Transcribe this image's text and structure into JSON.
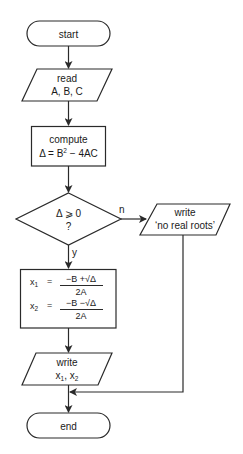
{
  "flowchart": {
    "start": {
      "label": "start"
    },
    "read": {
      "line1": "read",
      "line2": "A, B, C"
    },
    "compute": {
      "line1": "compute",
      "line2_prefix": "Δ = B",
      "line2_sup": "2",
      "line2_suffix": " − 4AC"
    },
    "decision": {
      "line1": "Δ ⩾ 0",
      "line2": "?",
      "yes_label": "y",
      "no_label": "n"
    },
    "roots": {
      "x1_var": "x",
      "x1_sub": "1",
      "x1_eq": "=",
      "x1_num": "−B +√Δ",
      "x1_den": "2A",
      "x2_var": "x",
      "x2_sub": "2",
      "x2_eq": "=",
      "x2_num": "−B −√Δ",
      "x2_den": "2A"
    },
    "write_roots": {
      "line1": "write",
      "x1_var": "x",
      "x1_sub": "1",
      "sep": ",",
      "x2_var": "x",
      "x2_sub": "2"
    },
    "write_no_roots": {
      "line1": "write",
      "line2": "‘no real roots’"
    },
    "end": {
      "label": "end"
    }
  }
}
